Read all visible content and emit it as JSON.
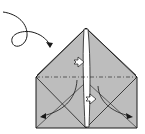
{
  "diagram": {
    "type": "origami-fold-step",
    "colors": {
      "paper": "#bdbdbd",
      "paper_dark": "#a8a8a8",
      "line": "#1a1a1a",
      "background": "#ffffff",
      "center_strip": "#ffffff"
    },
    "elements": [
      {
        "name": "turn-over-arrow",
        "description": "curly arrow indicating turn the model over"
      },
      {
        "name": "folded-paper-shape",
        "description": "house-shaped folded paper with pointed top"
      },
      {
        "name": "mountain-fold-line",
        "description": "dash-dot horizontal fold line"
      },
      {
        "name": "push-arrows",
        "description": "two hollow push arrows on center strip"
      },
      {
        "name": "fold-down-arrows",
        "description": "two curved arrows pointing to lower corners"
      }
    ]
  }
}
